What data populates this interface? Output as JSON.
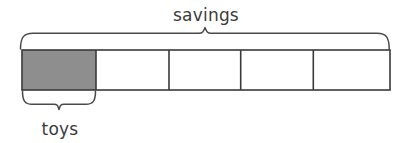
{
  "diagram": {
    "kind": "tape-diagram",
    "background_color": "#ffffff",
    "stroke_color": "#3a3a3a",
    "brace_color": "#4a4a4a",
    "text_color": "#3b3b3b",
    "total_parts": 5,
    "shaded_parts": 1,
    "fraction_shaded": "1/5",
    "top_label": "savings",
    "bottom_label": "toys",
    "tape": {
      "x": 22,
      "y": 50,
      "width": 368,
      "height": 40,
      "cell_boundaries": [
        22,
        96,
        169,
        240.7,
        313.3,
        390
      ],
      "cells": [
        {
          "index": 0,
          "label": "toys",
          "filled": true,
          "fill_color": "#8e8e8e"
        },
        {
          "index": 1,
          "label": "",
          "filled": false,
          "fill_color": "#ffffff"
        },
        {
          "index": 2,
          "label": "",
          "filled": false,
          "fill_color": "#ffffff"
        },
        {
          "index": 3,
          "label": "",
          "filled": false,
          "fill_color": "#ffffff"
        },
        {
          "index": 4,
          "label": "",
          "filled": false,
          "fill_color": "#ffffff"
        }
      ]
    },
    "top_brace": {
      "label": "savings",
      "left_x": 20,
      "right_x": 388,
      "line_y": 33,
      "tick_x": 205,
      "spans_parts": 5
    },
    "bottom_brace": {
      "label": "toys",
      "left_x": 22,
      "right_x": 96,
      "line_y": 104,
      "tick_x": 59,
      "spans_parts": 1
    },
    "labels": {
      "savings": {
        "text": "savings",
        "center_x": 206,
        "baseline_y": 21,
        "font_size": 17
      },
      "toys": {
        "text": "toys",
        "center_x": 60,
        "baseline_y": 135,
        "font_size": 17
      }
    }
  }
}
